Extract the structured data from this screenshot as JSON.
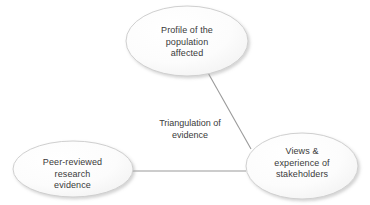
{
  "diagram": {
    "title": "Triangulation of evidence",
    "center_label": "Triangulation of\nevidence",
    "background_color": "#ffffff",
    "text_color": "#3a3a3a",
    "node_fill_color": "#fbfbfb",
    "node_border_color": "#cfcfcf",
    "connector_color": "#9a9a9a",
    "nodes": [
      {
        "id": "top",
        "label": "Profile of the\npopulation\naffected",
        "cx": 187,
        "cy": 41,
        "rx": 61,
        "ry": 35
      },
      {
        "id": "left",
        "label": "Peer-reviewed\nresearch\nevidence",
        "cx": 73,
        "cy": 169,
        "rx": 60,
        "ry": 28
      },
      {
        "id": "right",
        "label": "Views &\nexperience of\nstakeholders",
        "cx": 302,
        "cy": 166,
        "rx": 56,
        "ry": 33
      }
    ],
    "connectors": [
      {
        "id": "top-to-right",
        "from": "top",
        "to": "right",
        "x1": 207,
        "y1": 71,
        "x2": 251,
        "y2": 149
      },
      {
        "id": "left-to-right",
        "from": "left",
        "to": "right",
        "x1": 133,
        "y1": 171,
        "x2": 246,
        "y2": 171
      }
    ]
  }
}
